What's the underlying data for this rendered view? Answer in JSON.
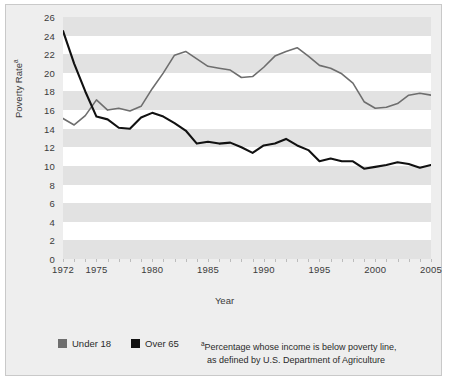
{
  "figure": {
    "background_color": "#eeeeee",
    "border_color": "#c9c9c9",
    "plot_background": "#ffffff",
    "band_color": "#e2e2e2"
  },
  "axes": {
    "y_title": "Poverty Rate",
    "y_title_superscript": "a",
    "x_title": "Year",
    "y_ticks": [
      0,
      2,
      4,
      6,
      8,
      10,
      12,
      14,
      16,
      18,
      20,
      22,
      24,
      26
    ],
    "x_ticks": [
      1972,
      1975,
      1980,
      1985,
      1990,
      1995,
      2000,
      2005
    ]
  },
  "legend": {
    "entries": [
      {
        "label": "Under 18",
        "color": "#6e6e6e"
      },
      {
        "label": "Over 65",
        "color": "#111111"
      }
    ]
  },
  "footnote": {
    "marker": "a",
    "line1": "Percentage whose income is below poverty line,",
    "line2": "as defined by U.S. Department of Agriculture"
  },
  "chart_data": {
    "type": "line",
    "title": "",
    "xlabel": "Year",
    "ylabel": "Poverty Rate",
    "ylim": [
      0,
      26
    ],
    "xlim": [
      1972,
      2005
    ],
    "grid": "horizontal-bands",
    "legend_position": "bottom-left",
    "x": [
      1972,
      1973,
      1974,
      1975,
      1976,
      1977,
      1978,
      1979,
      1980,
      1981,
      1982,
      1983,
      1984,
      1985,
      1986,
      1987,
      1988,
      1989,
      1990,
      1991,
      1992,
      1993,
      1994,
      1995,
      1996,
      1997,
      1998,
      1999,
      2000,
      2001,
      2002,
      2003,
      2004,
      2005
    ],
    "series": [
      {
        "name": "Under 18",
        "color": "#6e6e6e",
        "values": [
          15.1,
          14.4,
          15.4,
          17.1,
          16.0,
          16.2,
          15.9,
          16.4,
          18.3,
          20.0,
          21.9,
          22.3,
          21.5,
          20.7,
          20.5,
          20.3,
          19.5,
          19.6,
          20.6,
          21.8,
          22.3,
          22.7,
          21.8,
          20.8,
          20.5,
          19.9,
          18.9,
          16.9,
          16.2,
          16.3,
          16.7,
          17.6,
          17.8,
          17.6
        ]
      },
      {
        "name": "Over 65",
        "color": "#111111",
        "values": [
          24.5,
          21.0,
          18.0,
          15.3,
          15.0,
          14.1,
          14.0,
          15.2,
          15.7,
          15.3,
          14.6,
          13.8,
          12.4,
          12.6,
          12.4,
          12.5,
          12.0,
          11.4,
          12.2,
          12.4,
          12.9,
          12.2,
          11.7,
          10.5,
          10.8,
          10.5,
          10.5,
          9.7,
          9.9,
          10.1,
          10.4,
          10.2,
          9.8,
          10.1
        ]
      }
    ]
  }
}
